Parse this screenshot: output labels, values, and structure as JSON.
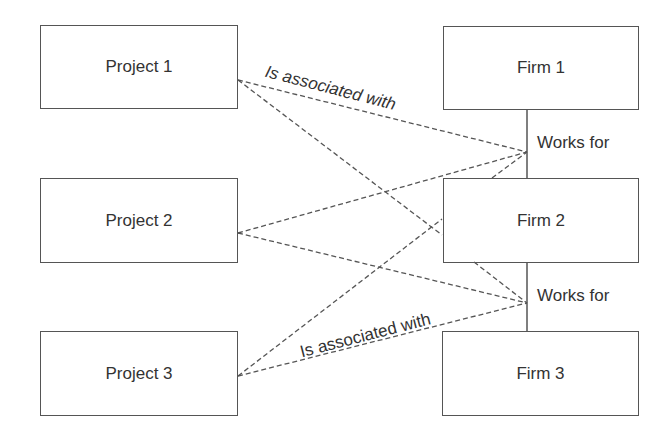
{
  "diagram": {
    "projects": [
      {
        "label": "Project 1"
      },
      {
        "label": "Project 2"
      },
      {
        "label": "Project 3"
      }
    ],
    "firms": [
      {
        "label": "Firm 1"
      },
      {
        "label": "Firm 2"
      },
      {
        "label": "Firm 3"
      }
    ],
    "relations": {
      "works_for_upper": "Works for",
      "works_for_lower": "Works for",
      "associated_upper": "Is associated with",
      "associated_lower": "Is associated with"
    },
    "colors": {
      "line": "#555555",
      "text": "#333333",
      "background": "#ffffff"
    }
  }
}
